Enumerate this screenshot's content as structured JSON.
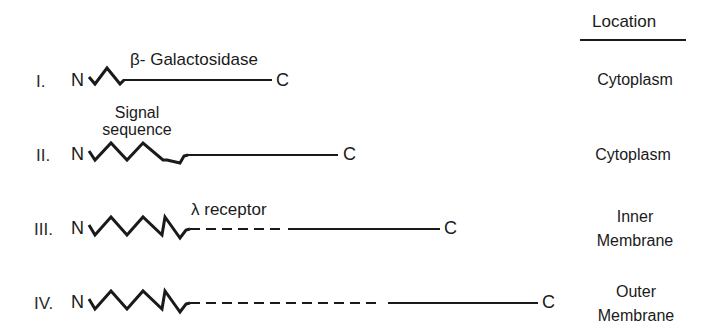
{
  "header": {
    "location_title": "Location"
  },
  "rows": [
    {
      "numeral": "I.",
      "n_terminus": "N",
      "c_terminus": "C",
      "annotation": "β- Galactosidase",
      "location": [
        "Cytoplasm"
      ],
      "signal_peaks": 1,
      "segments": [
        "zigzag",
        "solid"
      ]
    },
    {
      "numeral": "II.",
      "n_terminus": "N",
      "c_terminus": "C",
      "annotation_lines": [
        "Signal",
        "sequence"
      ],
      "location": [
        "Cytoplasm"
      ],
      "signal_peaks": 3,
      "segments": [
        "zigzag",
        "solid"
      ]
    },
    {
      "numeral": "III.",
      "n_terminus": "N",
      "c_terminus": "C",
      "annotation": "λ receptor",
      "location": [
        "Inner",
        "Membrane"
      ],
      "signal_peaks": 3,
      "segments": [
        "zigzag",
        "dashed",
        "solid"
      ]
    },
    {
      "numeral": "IV.",
      "n_terminus": "N",
      "c_terminus": "C",
      "location": [
        "Outer",
        "Membrane"
      ],
      "signal_peaks": 3,
      "segments": [
        "zigzag",
        "dashed",
        "solid"
      ]
    }
  ],
  "colors": {
    "ink": "#1a1a1a",
    "background": "#ffffff"
  }
}
